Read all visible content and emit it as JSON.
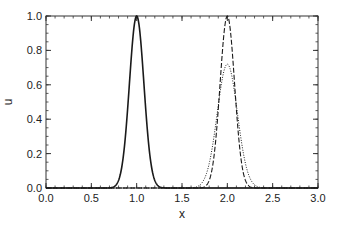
{
  "chart_data": {
    "type": "line",
    "title": "",
    "xlabel": "x",
    "ylabel": "u",
    "xlim": [
      0.0,
      3.0
    ],
    "ylim": [
      0.0,
      1.0
    ],
    "grid": false,
    "legend": null,
    "x_ticks": [
      "0.0",
      "0.5",
      "1.0",
      "1.5",
      "2.0",
      "2.5",
      "3.0"
    ],
    "y_ticks": [
      "0.0",
      "0.2",
      "0.4",
      "0.6",
      "0.8",
      "1.0"
    ],
    "series": [
      {
        "name": "initial",
        "style": "solid",
        "shape": "gaussian",
        "center": 1.0,
        "peak": 1.0,
        "sigma": 0.08
      },
      {
        "name": "exact",
        "style": "dashed",
        "shape": "gaussian",
        "center": 2.0,
        "peak": 1.0,
        "sigma": 0.08
      },
      {
        "name": "numerical",
        "style": "dotted",
        "shape": "gaussian",
        "center": 2.0,
        "peak": 0.72,
        "sigma": 0.111
      }
    ]
  },
  "colors": {
    "line": "#1a1a1a",
    "axis": "#333333",
    "background": "#ffffff"
  }
}
